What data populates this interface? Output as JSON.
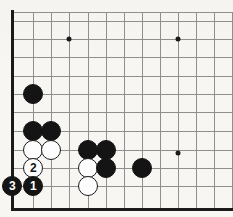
{
  "board": {
    "title": "Go board diagram - bottom left corner",
    "background_color": "#f7f6f3",
    "grid_color": "#8f8f8f",
    "edge_color": "#1a1a1a",
    "black_color": "#141414",
    "white_color": "#fdfdfd",
    "corner": "bottom-left",
    "stone_radius": 10,
    "x_lines": [
      12,
      33,
      51,
      69,
      88,
      106,
      124,
      142,
      160,
      178,
      196,
      214,
      232
    ],
    "y_lines": [
      21,
      39,
      57,
      76,
      94,
      112,
      131,
      150,
      168,
      186
    ],
    "left_edge_x": 12,
    "top_edge_y": 12,
    "bottom_edge_y": 208,
    "star_points": [
      {
        "name": "hoshi-top-left",
        "x": 69,
        "y": 39
      },
      {
        "name": "hoshi-top-right",
        "x": 178,
        "y": 39
      },
      {
        "name": "hoshi-right",
        "x": 178,
        "y": 153
      }
    ],
    "stones": [
      {
        "name": "black-stone-a",
        "color": "black",
        "x": 33,
        "y": 94,
        "label": ""
      },
      {
        "name": "black-stone-b",
        "color": "black",
        "x": 33,
        "y": 131,
        "label": ""
      },
      {
        "name": "black-stone-c",
        "color": "black",
        "x": 51,
        "y": 131,
        "label": ""
      },
      {
        "name": "white-stone-a",
        "color": "white",
        "x": 33,
        "y": 150,
        "label": ""
      },
      {
        "name": "white-stone-b",
        "color": "white",
        "x": 51,
        "y": 150,
        "label": ""
      },
      {
        "name": "black-stone-d",
        "color": "black",
        "x": 88,
        "y": 150,
        "label": ""
      },
      {
        "name": "black-stone-e",
        "color": "black",
        "x": 106,
        "y": 150,
        "label": ""
      },
      {
        "name": "white-stone-c",
        "color": "white",
        "x": 88,
        "y": 168,
        "label": ""
      },
      {
        "name": "black-stone-f",
        "color": "black",
        "x": 106,
        "y": 168,
        "label": ""
      },
      {
        "name": "black-stone-g",
        "color": "black",
        "x": 142,
        "y": 168,
        "label": ""
      },
      {
        "name": "white-stone-move-2",
        "color": "white",
        "x": 33,
        "y": 168,
        "label": "2"
      },
      {
        "name": "white-stone-d",
        "color": "white",
        "x": 88,
        "y": 186,
        "label": ""
      },
      {
        "name": "black-stone-move-3",
        "color": "black",
        "x": 12,
        "y": 186,
        "label": "3"
      },
      {
        "name": "black-stone-move-1",
        "color": "black",
        "x": 33,
        "y": 186,
        "label": "1"
      }
    ],
    "move_sequence": [
      {
        "number": "1",
        "color": "black"
      },
      {
        "number": "2",
        "color": "white"
      },
      {
        "number": "3",
        "color": "black"
      }
    ]
  }
}
